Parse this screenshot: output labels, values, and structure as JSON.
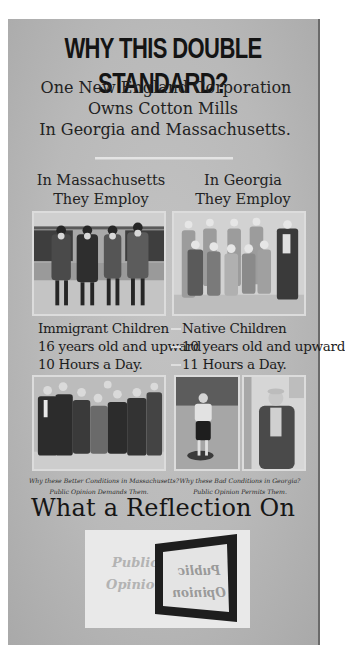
{
  "poster": {
    "headline": "WHY THIS DOUBLE STANDARD?",
    "subhead": [
      "One New England Corporation",
      "Owns Cotton Mills",
      "In Georgia and Massachusetts."
    ],
    "columns": {
      "massachusetts": {
        "heading": [
          "In Massachusetts",
          "They Employ"
        ],
        "facts": [
          "Immigrant Children",
          "16 years old and upward",
          "10 Hours a Day."
        ],
        "caption": [
          "Why these Better Conditions in Massachusetts?",
          "Public Opinion Demands Them."
        ],
        "photos": [
          {
            "description": "four boys standing in a row in front of a building"
          },
          {
            "description": "group of boys and young men standing together"
          }
        ]
      },
      "georgia": {
        "heading": [
          "In Georgia",
          "They Employ"
        ],
        "facts": [
          "Native Children",
          "10 years old and upward",
          "11 Hours a Day."
        ],
        "caption": [
          "Why these Bad Conditions in Georgia?",
          "Public Opinion Permits Them."
        ],
        "photos": [
          {
            "description": "large group of young children standing with older workers"
          },
          {
            "description": "small boy standing in a field"
          },
          {
            "description": "young boy in a cap and jacket"
          }
        ]
      }
    },
    "reflection_title": "What a Reflection On",
    "mirror_card": {
      "text": [
        "Public",
        "Opinion"
      ],
      "mirrored_text": [
        "Public",
        "Opinion"
      ]
    }
  }
}
